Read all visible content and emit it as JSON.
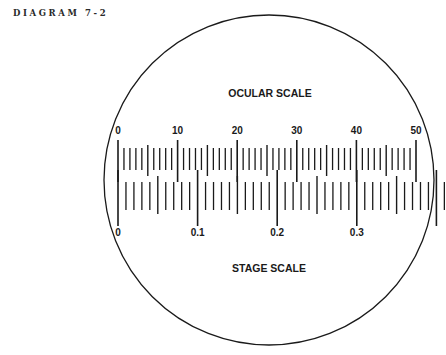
{
  "caption": "DIAGRAM 7-2",
  "colors": {
    "ink": "#1a1a1a",
    "background": "#ffffff"
  },
  "field_of_view": {
    "cx": 269,
    "cy": 180,
    "r": 165
  },
  "ocular_scale": {
    "title": "OCULAR SCALE",
    "title_pos": {
      "x": 270,
      "y": 97
    },
    "start_x": 118,
    "unit_px": 5.96,
    "divisions": 50,
    "labels": [
      "0",
      "10",
      "20",
      "30",
      "40",
      "50"
    ],
    "label_every": 10,
    "label_y": 134,
    "tick_y_base": 152,
    "long_top": 140,
    "long_bottom": 182,
    "mid_top": 145,
    "mid_bottom": 176,
    "short_top": 148,
    "short_bottom": 170
  },
  "stage_scale": {
    "title": "STAGE SCALE",
    "title_pos": {
      "x": 269,
      "y": 272
    },
    "start_x": 118,
    "unit_px": 7.96,
    "divisions": 41,
    "labels": [
      "0",
      "0.1",
      "0.2",
      "0.3"
    ],
    "label_every": 10,
    "label_y": 236,
    "long_top": 170,
    "long_bottom": 226,
    "mid_top": 176,
    "mid_bottom": 214,
    "short_top": 182,
    "short_bottom": 210
  },
  "chart_data": {
    "type": "diagram",
    "title": "DIAGRAM 7-2",
    "scales": [
      {
        "name": "OCULAR SCALE",
        "ticks": 51,
        "labels": [
          0,
          10,
          20,
          30,
          40,
          50
        ],
        "units": "ocular divisions"
      },
      {
        "name": "STAGE SCALE",
        "ticks": 41,
        "labels": [
          0,
          0.1,
          0.2,
          0.3
        ],
        "units": "mm",
        "division": 0.01
      }
    ],
    "alignment": [
      {
        "ocular": 0,
        "stage": 0
      },
      {
        "ocular": 40,
        "stage": 0.3
      }
    ]
  }
}
